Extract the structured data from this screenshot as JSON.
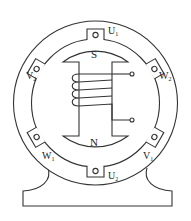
{
  "diagram": {
    "type": "three-phase synchronous generator cross-section",
    "rotor": {
      "north_label": "N",
      "south_label": "S"
    },
    "terminals": [
      {
        "id": "U1",
        "base": "U",
        "sub": "1",
        "position": "top"
      },
      {
        "id": "W2",
        "base": "W",
        "sub": "2",
        "position": "upper-right"
      },
      {
        "id": "V1",
        "base": "V",
        "sub": "1",
        "position": "lower-right"
      },
      {
        "id": "U2",
        "base": "U",
        "sub": "2",
        "position": "bottom"
      },
      {
        "id": "W1",
        "base": "W",
        "sub": "1",
        "position": "lower-left"
      },
      {
        "id": "V2",
        "base": "V",
        "sub": "2",
        "position": "upper-left"
      }
    ],
    "colors": {
      "line": "#333333",
      "background": "#ffffff"
    }
  }
}
